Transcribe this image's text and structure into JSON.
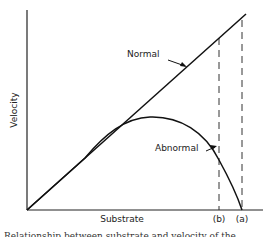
{
  "diagram": {
    "type": "line",
    "axes": {
      "xlabel": "Substrate",
      "ylabel": "Velocity"
    },
    "curves": [
      {
        "name": "Normal",
        "label": "Normal",
        "shape": "straight line through origin"
      },
      {
        "name": "Abnormal",
        "label": "Abnormal",
        "shape": "follows normal initially, peaks, then falls to zero at (a)"
      }
    ],
    "markers": [
      {
        "label": "(b)",
        "style": "dashed vertical"
      },
      {
        "label": "(a)",
        "style": "dashed vertical"
      }
    ],
    "caption": "Relationship between substrate and velocity of the"
  }
}
